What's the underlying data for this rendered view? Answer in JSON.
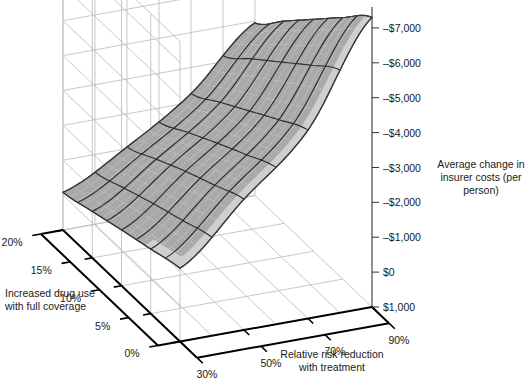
{
  "chart_data": {
    "type": "surface",
    "title": "",
    "xlabel": "Relative risk reduction with treatment",
    "ylabel": "Increased drug use with full coverage",
    "zlabel": "Average change in insurer costs (per person)",
    "x": [
      30,
      50,
      70,
      90
    ],
    "x_tick_labels": [
      "30%",
      "50%",
      "70%",
      "90%"
    ],
    "y": [
      0,
      5,
      10,
      15,
      20
    ],
    "y_tick_labels": [
      "0%",
      "5%",
      "10%",
      "15%",
      "20%"
    ],
    "z_ticks": [
      1000,
      0,
      -1000,
      -2000,
      -3000,
      -4000,
      -5000,
      -6000,
      -7000
    ],
    "z_tick_labels": [
      "$1,000",
      "$0",
      "–$1,000",
      "–$2,000",
      "–$3,000",
      "–$4,000",
      "–$5,000",
      "–$6,000",
      "–$7,000"
    ],
    "zlim": [
      1000,
      -7600
    ],
    "grid": true,
    "legend": "none",
    "series": [
      {
        "name": "Average change in insurer costs (per person)",
        "z_rows_by_y": [
          {
            "y": 0,
            "values": [
              -1100,
              -2750,
              -4400,
              -7300
            ]
          },
          {
            "y": 5,
            "values": [
              -850,
              -2350,
              -3900,
              -6500
            ]
          },
          {
            "y": 10,
            "values": [
              -600,
              -1950,
              -3350,
              -5650
            ]
          },
          {
            "y": 15,
            "values": [
              -330,
              -1500,
              -2800,
              -4800
            ]
          },
          {
            "y": 20,
            "values": [
              -80,
              -1050,
              -2250,
              -3950
            ]
          }
        ]
      }
    ]
  },
  "axes": {
    "z": {
      "title_line1": "Average change in",
      "title_line2": "insurer costs (per",
      "title_line3": "person)",
      "ticks": [
        {
          "label": "–$7,000"
        },
        {
          "label": "–$6,000"
        },
        {
          "label": "–$5,000"
        },
        {
          "label": "–$4,000"
        },
        {
          "label": "–$3,000"
        },
        {
          "label": "–$2,000"
        },
        {
          "label": "–$1,000"
        },
        {
          "label": "$0"
        },
        {
          "label": "$1,000"
        }
      ]
    },
    "x": {
      "title_line1": "Relative risk reduction",
      "title_line2": "with treatment",
      "ticks": [
        {
          "label": "30%"
        },
        {
          "label": "50%"
        },
        {
          "label": "70%"
        },
        {
          "label": "90%"
        }
      ]
    },
    "y": {
      "title_line1": "Increased drug use",
      "title_line2": "with full coverage",
      "ticks": [
        {
          "label": "0%"
        },
        {
          "label": "5%"
        },
        {
          "label": "10%"
        },
        {
          "label": "15%"
        },
        {
          "label": "20%"
        }
      ]
    }
  },
  "colors": {
    "surface": "#a9a9a9",
    "surface_light": "#cfcfcf",
    "mesh": "#2b2b2b",
    "grid": "#b9b9b9",
    "axis": "#000000",
    "text": "#1a1a1a",
    "background": "#ffffff"
  }
}
